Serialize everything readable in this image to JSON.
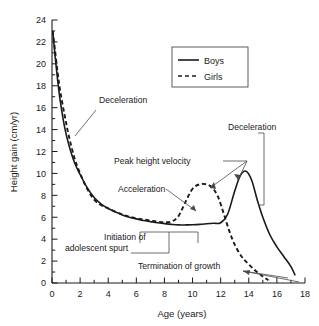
{
  "chart_data": {
    "type": "line",
    "title": "",
    "xlabel": "Age (years)",
    "ylabel": "Height gain (cm/yr)",
    "xlim": [
      0,
      18
    ],
    "ylim": [
      0,
      24
    ],
    "xticks": [
      0,
      2,
      4,
      6,
      8,
      10,
      12,
      14,
      16,
      18
    ],
    "xticklabels": [
      "0",
      "2",
      "4",
      "6",
      "8",
      "10",
      "12",
      "14",
      "16",
      "18"
    ],
    "x_minor_tick_step": 1,
    "yticks": [
      0,
      2,
      4,
      6,
      8,
      10,
      12,
      14,
      16,
      18,
      20,
      22,
      24
    ],
    "yticklabels": [
      "0",
      "2",
      "4",
      "6",
      "8",
      "10",
      "12",
      "14",
      "16",
      "18",
      "20",
      "22",
      "24"
    ],
    "y_minor_tick_step": 1,
    "grid": false,
    "legend_position": "upper-center",
    "series": [
      {
        "name": "Boys",
        "style": "solid",
        "color": "#1a1a1a",
        "x": [
          0.05,
          0.2,
          0.4,
          0.6,
          0.9,
          1.2,
          1.6,
          2.0,
          2.5,
          3.0,
          3.5,
          4.0,
          4.5,
          5.0,
          5.5,
          6.0,
          6.5,
          7.0,
          7.5,
          8.0,
          8.5,
          9.0,
          9.5,
          10.0,
          10.5,
          11.0,
          11.5,
          12.0,
          12.5,
          13.0,
          13.4,
          13.8,
          14.2,
          14.6,
          15.0,
          15.5,
          16.0,
          16.5,
          17.0,
          17.3
        ],
        "y": [
          23.0,
          21.0,
          18.5,
          16.5,
          14.2,
          12.6,
          11.0,
          9.9,
          8.7,
          7.8,
          7.2,
          6.8,
          6.5,
          6.2,
          6.0,
          5.85,
          5.7,
          5.6,
          5.5,
          5.42,
          5.35,
          5.3,
          5.3,
          5.32,
          5.35,
          5.4,
          5.45,
          5.5,
          6.3,
          8.4,
          9.8,
          10.2,
          9.4,
          7.6,
          6.0,
          4.4,
          3.3,
          2.4,
          1.5,
          0.7
        ]
      },
      {
        "name": "Girls",
        "style": "dashed",
        "color": "#1a1a1a",
        "x": [
          0.05,
          0.2,
          0.4,
          0.6,
          0.9,
          1.2,
          1.6,
          2.0,
          2.5,
          3.0,
          3.5,
          4.0,
          4.5,
          5.0,
          5.5,
          6.0,
          6.5,
          7.0,
          7.5,
          8.0,
          8.5,
          9.0,
          9.5,
          10.0,
          10.5,
          11.0,
          11.4,
          11.8,
          12.2,
          12.6,
          13.0,
          13.5,
          14.0,
          14.5,
          15.0,
          15.4
        ],
        "y": [
          23.0,
          21.4,
          19.2,
          17.4,
          15.3,
          13.4,
          11.4,
          10.0,
          8.6,
          7.6,
          7.1,
          6.8,
          6.5,
          6.25,
          6.05,
          5.9,
          5.8,
          5.7,
          5.6,
          5.55,
          5.6,
          6.1,
          7.4,
          8.6,
          9.0,
          9.0,
          8.7,
          7.9,
          6.4,
          4.8,
          3.5,
          2.4,
          1.7,
          1.1,
          0.6,
          0.25
        ]
      }
    ],
    "annotations": [
      {
        "id": "deceleration-infancy",
        "text": "Deceleration",
        "x": 3.8,
        "y": 15.6
      },
      {
        "id": "peak-height-velocity",
        "text": "Peak height velocity",
        "x": 5.0,
        "y": 10.8
      },
      {
        "id": "acceleration",
        "text": "Acceleration",
        "x": 5.2,
        "y": 8.4
      },
      {
        "id": "initiation-line1",
        "text": "Initiation of",
        "x": 5.6,
        "y": 3.9
      },
      {
        "id": "initiation-line2",
        "text": "adolescent spurt",
        "x": 4.2,
        "y": 2.9
      },
      {
        "id": "termination-of-growth",
        "text": "Termination of growth",
        "x": 7.0,
        "y": 1.4
      },
      {
        "id": "deceleration-adolescence",
        "text": "Deceleration",
        "x": 13.3,
        "y": 13.0
      }
    ],
    "legend_entries": [
      {
        "label": "Boys",
        "style": "solid"
      },
      {
        "label": "Girls",
        "style": "dashed"
      }
    ]
  }
}
